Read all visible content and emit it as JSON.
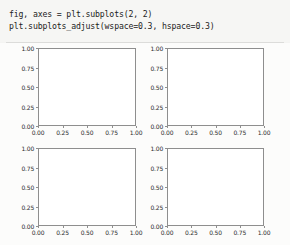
{
  "notebook": {
    "code_cell": {
      "lines": [
        "fig, axes = plt.subplots(2, 2)",
        "plt.subplots_adjust(wspace=0.3, hspace=0.3)"
      ]
    }
  },
  "colors": {
    "page_background": "#f4f4f2",
    "code_background": "#f6f6f4",
    "figure_background": "#fcfcfb",
    "axes_background": "#ffffff",
    "spine": "#8e8e8e",
    "text": "#1c1c1c",
    "ticklabel": "#2b2b2b"
  },
  "chart_data": [
    {
      "type": "line",
      "title": "",
      "xlabel": "",
      "ylabel": "",
      "position": "row-0-col-0",
      "grid": false,
      "legend": null,
      "xlim": [
        0.0,
        1.0
      ],
      "ylim": [
        0.0,
        1.0
      ],
      "xticks": [
        0.0,
        0.25,
        0.5,
        0.75,
        1.0
      ],
      "yticks": [
        0.0,
        0.25,
        0.5,
        0.75,
        1.0
      ],
      "xticklabels": [
        "0.00",
        "0.25",
        "0.50",
        "0.75",
        "1.00"
      ],
      "yticklabels": [
        "0.00",
        "0.25",
        "0.50",
        "0.75",
        "1.00"
      ],
      "series": []
    },
    {
      "type": "line",
      "title": "",
      "xlabel": "",
      "ylabel": "",
      "position": "row-0-col-1",
      "grid": false,
      "legend": null,
      "xlim": [
        0.0,
        1.0
      ],
      "ylim": [
        0.0,
        1.0
      ],
      "xticks": [
        0.0,
        0.25,
        0.5,
        0.75,
        1.0
      ],
      "yticks": [
        0.0,
        0.25,
        0.5,
        0.75,
        1.0
      ],
      "xticklabels": [
        "0.00",
        "0.25",
        "0.50",
        "0.75",
        "1.00"
      ],
      "yticklabels": [
        "0.00",
        "0.25",
        "0.50",
        "0.75",
        "1.00"
      ],
      "series": []
    },
    {
      "type": "line",
      "title": "",
      "xlabel": "",
      "ylabel": "",
      "position": "row-1-col-0",
      "grid": false,
      "legend": null,
      "xlim": [
        0.0,
        1.0
      ],
      "ylim": [
        0.0,
        1.0
      ],
      "xticks": [
        0.0,
        0.25,
        0.5,
        0.75,
        1.0
      ],
      "yticks": [
        0.0,
        0.25,
        0.5,
        0.75,
        1.0
      ],
      "xticklabels": [
        "0.00",
        "0.25",
        "0.50",
        "0.75",
        "1.00"
      ],
      "yticklabels": [
        "0.00",
        "0.25",
        "0.50",
        "0.75",
        "1.00"
      ],
      "series": []
    },
    {
      "type": "line",
      "title": "",
      "xlabel": "",
      "ylabel": "",
      "position": "row-1-col-1",
      "grid": false,
      "legend": null,
      "xlim": [
        0.0,
        1.0
      ],
      "ylim": [
        0.0,
        1.0
      ],
      "xticks": [
        0.0,
        0.25,
        0.5,
        0.75,
        1.0
      ],
      "yticks": [
        0.0,
        0.25,
        0.5,
        0.75,
        1.0
      ],
      "xticklabels": [
        "0.00",
        "0.25",
        "0.50",
        "0.75",
        "1.00"
      ],
      "yticklabels": [
        "0.00",
        "0.25",
        "0.50",
        "0.75",
        "1.00"
      ],
      "series": []
    }
  ]
}
